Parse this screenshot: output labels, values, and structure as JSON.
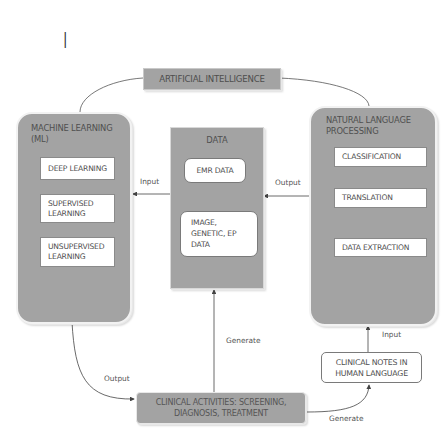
{
  "figure_marker": "I",
  "nodes": {
    "ai": {
      "label": "ARTIFICIAL INTELLIGENCE"
    },
    "ml": {
      "title_line1": "MACHINE LEARNING",
      "title_line2": "(ML)",
      "items": [
        {
          "line1": "DEEP LEARNING",
          "line2": ""
        },
        {
          "line1": "SUPERVISED",
          "line2": "LEARNING"
        },
        {
          "line1": "UNSUPERVISED",
          "line2": "LEARNING"
        }
      ]
    },
    "data": {
      "title": "DATA",
      "items": [
        {
          "line1": "EMR DATA"
        },
        {
          "line1": "IMAGE,",
          "line2": "GENETIC, EP",
          "line3": "DATA"
        }
      ]
    },
    "nlp": {
      "title_line1": "NATURAL LANGUAGE",
      "title_line2": "PROCESSING",
      "items": [
        {
          "label": "CLASSIFICATION"
        },
        {
          "label": "TRANSLATION"
        },
        {
          "label": "DATA EXTRACTION"
        }
      ]
    },
    "clinical_notes": {
      "line1": "CLINICAL NOTES IN",
      "line2": "HUMAN LANGUAGE"
    },
    "clinical_activities": {
      "line1": "CLINICAL ACTIVITIES: SCREENING,",
      "line2": "DIAGNOSIS, TREATMENT"
    }
  },
  "edges": {
    "data_to_ml": "Input",
    "nlp_to_data": "Output",
    "clinical_to_data": "Generate",
    "ml_to_clinical": "Output",
    "clinical_to_notes": "Generate",
    "notes_to_nlp": "Input"
  },
  "colors": {
    "box_fill": "#a3a3a3",
    "inner_fill": "#ffffff",
    "line": "#444444"
  }
}
